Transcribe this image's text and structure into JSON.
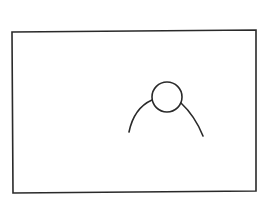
{
  "drawing": {
    "stroke_color": "#2a2a2a",
    "background": "#ffffff",
    "frame": {
      "x1": 12,
      "y1": 31,
      "x2": 256,
      "y2": 192
    },
    "figure": {
      "head": {
        "cx": 167,
        "cy": 97,
        "r": 15
      },
      "left_shoulder": "M129,132 Q134,108 152,100",
      "right_shoulder": "M181,103 Q195,116 203,136"
    }
  }
}
